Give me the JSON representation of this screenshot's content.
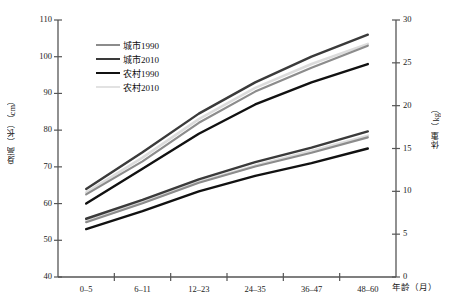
{
  "chart_data": {
    "type": "line",
    "title": "",
    "categories": [
      "0–5",
      "6–11",
      "12–23",
      "24–35",
      "36–47",
      "48–60"
    ],
    "xlabel": "年龄（月）",
    "ylabel_left": "身高（长）（cm）",
    "ylabel_right": "体重（kg）",
    "ylim_left": [
      40,
      110
    ],
    "ylim_right": [
      0,
      30
    ],
    "yticks_left": [
      40,
      50,
      60,
      70,
      80,
      90,
      100,
      110
    ],
    "yticks_right": [
      0,
      5,
      10,
      15,
      20,
      25,
      30
    ],
    "grid": false,
    "legend_position": "upper-left-inside",
    "series": [
      {
        "name": "城市1990",
        "color": "#8c8c8c",
        "width": 2.2,
        "metric": "height",
        "axis": "left",
        "values": [
          62.5,
          71.5,
          82.0,
          90.5,
          97.0,
          103.0
        ]
      },
      {
        "name": "城市2010",
        "color": "#3a3a3a",
        "width": 2.4,
        "metric": "height",
        "axis": "left",
        "values": [
          64.0,
          74.0,
          84.5,
          93.0,
          100.0,
          106.0
        ]
      },
      {
        "name": "农村1990",
        "color": "#111111",
        "width": 2.4,
        "metric": "height",
        "axis": "left",
        "values": [
          60.0,
          69.5,
          79.0,
          87.0,
          93.0,
          98.0
        ]
      },
      {
        "name": "农村2010",
        "color": "#dcdcdc",
        "width": 2.6,
        "metric": "height",
        "axis": "left",
        "values": [
          63.0,
          72.5,
          83.0,
          91.5,
          98.0,
          103.5
        ]
      },
      {
        "name": "城市1990",
        "color": "#8c8c8c",
        "width": 2.2,
        "metric": "weight",
        "axis": "right",
        "values": [
          6.4,
          8.6,
          11.0,
          12.9,
          14.5,
          16.3
        ]
      },
      {
        "name": "城市2010",
        "color": "#3a3a3a",
        "width": 2.4,
        "metric": "weight",
        "axis": "right",
        "values": [
          6.8,
          9.0,
          11.4,
          13.4,
          15.1,
          17.0
        ]
      },
      {
        "name": "农村1990",
        "color": "#111111",
        "width": 2.4,
        "metric": "weight",
        "axis": "right",
        "values": [
          5.6,
          7.7,
          10.0,
          11.8,
          13.3,
          15.0
        ]
      },
      {
        "name": "农村2010",
        "color": "#dcdcdc",
        "width": 2.6,
        "metric": "weight",
        "axis": "right",
        "values": [
          6.5,
          8.7,
          11.1,
          13.0,
          14.7,
          16.5
        ]
      }
    ]
  },
  "legend": {
    "items": [
      {
        "label": "城市1990",
        "color": "#8c8c8c",
        "width": "2.2px"
      },
      {
        "label": "城市2010",
        "color": "#3a3a3a",
        "width": "2.6px"
      },
      {
        "label": "农村1990",
        "color": "#111111",
        "width": "2.8px"
      },
      {
        "label": "农村2010",
        "color": "#e2e2e2",
        "width": "2.6px"
      }
    ]
  },
  "axes": {
    "left_ticks": [
      "110",
      "100",
      "90",
      "80",
      "70",
      "60",
      "50",
      "40"
    ],
    "right_ticks": [
      "30",
      "25",
      "20",
      "15",
      "10",
      "5",
      "0"
    ],
    "x_ticks": [
      "0–5",
      "6–11",
      "12–23",
      "24–35",
      "36–47",
      "48–60"
    ],
    "x_title": "年龄（月）",
    "y_left_title": "身高（长）（cm）",
    "y_right_title": "体重（kg）"
  }
}
